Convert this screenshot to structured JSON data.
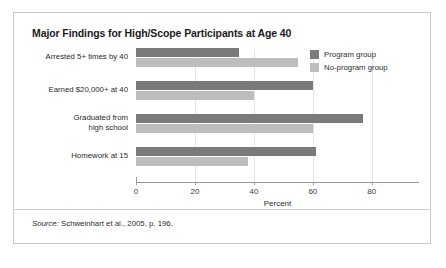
{
  "figure": {
    "title": "Major Findings for High/Scope Participants at Age 40",
    "source_label": "Source:",
    "source_text": " Schweinhart et al., 2005, p. 196."
  },
  "legend": {
    "position": "top-right",
    "items": [
      {
        "label": "Program group",
        "color": "#7a7a7a",
        "swatch_name": "legend-swatch-program"
      },
      {
        "label": "No-program group",
        "color": "#bdbdbd",
        "swatch_name": "legend-swatch-no-program"
      }
    ]
  },
  "chart_data": {
    "type": "bar",
    "orientation": "horizontal",
    "title": "Major Findings for High/Scope Participants at Age 40",
    "xlabel": "Percent",
    "ylabel": "",
    "xlim": [
      0,
      95
    ],
    "xticks": [
      0,
      20,
      40,
      60,
      80
    ],
    "xtick_labels": [
      "0",
      "20",
      "40",
      "60",
      "80"
    ],
    "grid": true,
    "grid_axis": "x",
    "legend_position": "top-right",
    "categories": [
      "Arrested 5+ times by 40",
      "Earned $20,000+ at 40",
      "Graduated from\nhigh school",
      "Homework at 15"
    ],
    "category_lines": [
      [
        "Arrested 5+ times by 40"
      ],
      [
        "Earned $20,000+ at 40"
      ],
      [
        "Graduated from",
        "high school"
      ],
      [
        "Homework at 15"
      ]
    ],
    "series": [
      {
        "name": "Program group",
        "color": "#7a7a7a",
        "values": [
          35,
          60,
          77,
          61
        ]
      },
      {
        "name": "No-program group",
        "color": "#bdbdbd",
        "values": [
          55,
          40,
          60,
          38
        ]
      }
    ]
  }
}
